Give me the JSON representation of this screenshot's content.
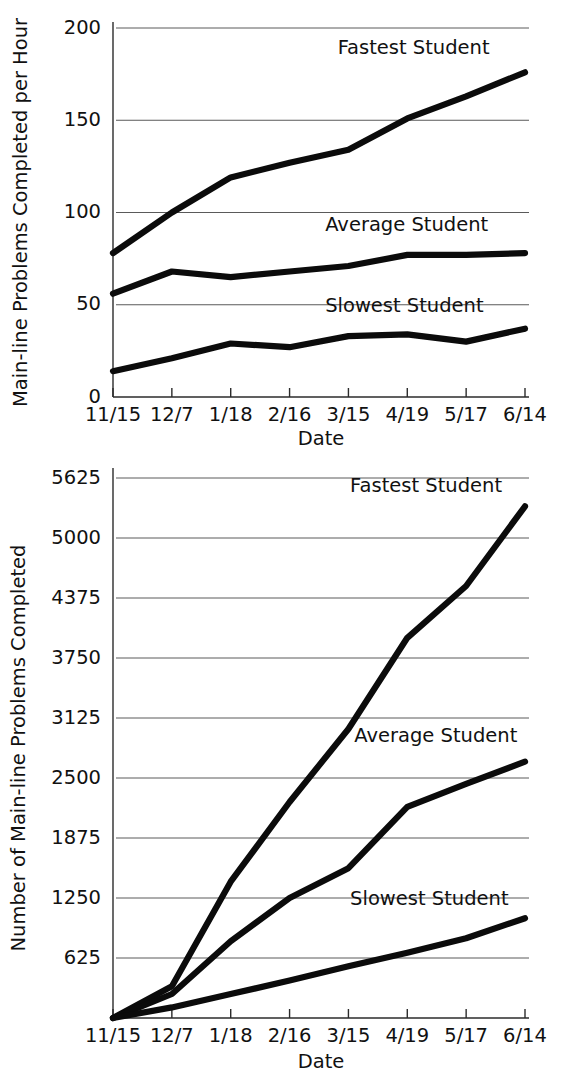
{
  "chart_data": [
    {
      "id": "rate-chart",
      "type": "line",
      "title": "",
      "xlabel": "Date",
      "ylabel": "Main-line Problems Completed per Hour",
      "categories": [
        "11/15",
        "12/7",
        "1/18",
        "2/16",
        "3/15",
        "4/19",
        "5/17",
        "6/14"
      ],
      "ylim": [
        0,
        200
      ],
      "yticks": [
        0,
        50,
        100,
        150,
        200
      ],
      "ytick_labels": [
        "0",
        "50",
        "100",
        "150",
        "200"
      ],
      "grid": true,
      "legend_position": "inline-annotations",
      "series": [
        {
          "name": "Fastest Student",
          "values": [
            78,
            100,
            119,
            127,
            134,
            151,
            163,
            176
          ]
        },
        {
          "name": "Average Student",
          "values": [
            56,
            68,
            65,
            68,
            71,
            77,
            77,
            78
          ]
        },
        {
          "name": "Slowest Student",
          "values": [
            14,
            21,
            29,
            27,
            33,
            34,
            30,
            37
          ]
        }
      ],
      "annotations": [
        {
          "text": "Fastest Student",
          "x_frac": 0.54,
          "value": 186
        },
        {
          "text": "Average Student",
          "x_frac": 0.51,
          "value": 90
        },
        {
          "text": "Slowest Student",
          "x_frac": 0.51,
          "value": 46
        }
      ]
    },
    {
      "id": "cumulative-chart",
      "type": "line",
      "title": "",
      "xlabel": "Date",
      "ylabel": "Number of Main-line Problems Completed",
      "categories": [
        "11/15",
        "12/7",
        "1/18",
        "2/16",
        "3/15",
        "4/19",
        "5/17",
        "6/14"
      ],
      "ylim": [
        0,
        5625
      ],
      "yticks": [
        625,
        1250,
        1875,
        2500,
        3125,
        3750,
        4375,
        5000,
        5625
      ],
      "ytick_labels": [
        "625",
        "1250",
        "1875",
        "2500",
        "3125",
        "3750",
        "4375",
        "5000",
        "5625"
      ],
      "grid": true,
      "legend_position": "inline-annotations",
      "series": [
        {
          "name": "Fastest Student",
          "values": [
            0,
            330,
            1420,
            2250,
            3010,
            3960,
            4500,
            5330
          ]
        },
        {
          "name": "Average Student",
          "values": [
            0,
            250,
            800,
            1250,
            1560,
            2200,
            2440,
            2670
          ]
        },
        {
          "name": "Slowest Student",
          "values": [
            0,
            110,
            250,
            390,
            540,
            680,
            830,
            1040
          ]
        }
      ],
      "annotations": [
        {
          "text": "Fastest Student",
          "x_frac": 0.57,
          "value": 5480
        },
        {
          "text": "Average Student",
          "x_frac": 0.58,
          "value": 2880
        },
        {
          "text": "Slowest Student",
          "x_frac": 0.57,
          "value": 1180
        }
      ]
    }
  ],
  "colors": {
    "line": "#0b0b0b",
    "grid": "#5a5a5a",
    "axis": "#2b2b2b",
    "text": "#111111",
    "background": "#ffffff"
  }
}
